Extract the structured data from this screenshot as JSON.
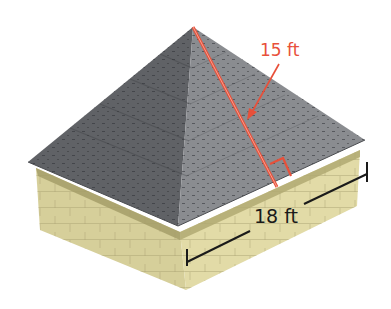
{
  "figure": {
    "slant_height_label": "15 ft",
    "base_side_label": "18 ft",
    "colors": {
      "slant_red": "#e8503a",
      "roof_dark": "#5d5f63",
      "roof_light": "#8a8c90",
      "wall_light": "#ddd6a2",
      "wall_dark": "#cbc48e",
      "trim": "#a59e69",
      "dimension_line": "#1a1a1a"
    }
  }
}
